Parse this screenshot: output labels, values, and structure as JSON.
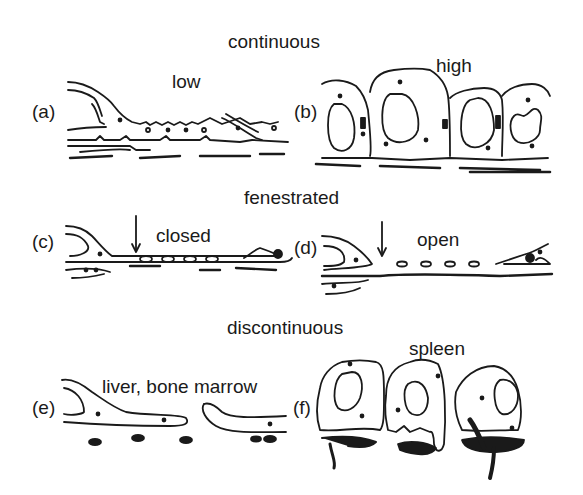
{
  "diagram": {
    "sections": [
      {
        "heading": "continuous",
        "panels": [
          {
            "id": "a",
            "label": "(a)",
            "title": "low"
          },
          {
            "id": "b",
            "label": "(b)",
            "title": "high"
          }
        ]
      },
      {
        "heading": "fenestrated",
        "panels": [
          {
            "id": "c",
            "label": "(c)",
            "title": "closed"
          },
          {
            "id": "d",
            "label": "(d)",
            "title": "open"
          }
        ]
      },
      {
        "heading": "discontinuous",
        "panels": [
          {
            "id": "e",
            "label": "(e)",
            "title": "liver, bone marrow"
          },
          {
            "id": "f",
            "label": "(f)",
            "title": "spleen"
          }
        ]
      }
    ],
    "colors": {
      "ink": "#1a1a1a",
      "background": "#ffffff"
    }
  }
}
